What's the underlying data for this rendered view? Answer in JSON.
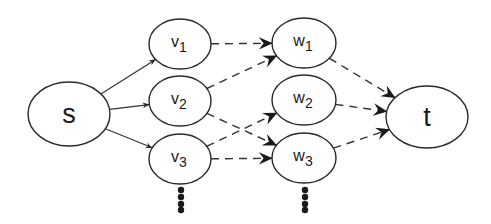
{
  "diagram": {
    "type": "flow-network",
    "colors": {
      "stroke": "#2a2a2a",
      "fill": "#ffffff",
      "text": "#1a1a1a"
    },
    "nodes": [
      {
        "id": "s",
        "label": "s",
        "sub": "",
        "cx": 69,
        "cy": 114,
        "rx": 41,
        "ry": 32
      },
      {
        "id": "v1",
        "label": "v",
        "sub": "1",
        "cx": 180,
        "cy": 44,
        "rx": 31,
        "ry": 25
      },
      {
        "id": "v2",
        "label": "v",
        "sub": "2",
        "cx": 180,
        "cy": 101,
        "rx": 31,
        "ry": 25
      },
      {
        "id": "v3",
        "label": "v",
        "sub": "3",
        "cx": 180,
        "cy": 159,
        "rx": 31,
        "ry": 25
      },
      {
        "id": "w1",
        "label": "w",
        "sub": "1",
        "cx": 304,
        "cy": 43,
        "rx": 32,
        "ry": 25
      },
      {
        "id": "w2",
        "label": "w",
        "sub": "2",
        "cx": 304,
        "cy": 100,
        "rx": 32,
        "ry": 25
      },
      {
        "id": "w3",
        "label": "w",
        "sub": "3",
        "cx": 304,
        "cy": 158,
        "rx": 32,
        "ry": 25
      },
      {
        "id": "t",
        "label": "t",
        "sub": "",
        "cx": 427,
        "cy": 117,
        "rx": 41,
        "ry": 31
      }
    ],
    "edges": [
      {
        "from": "s",
        "to": "v1",
        "style": "solid"
      },
      {
        "from": "s",
        "to": "v2",
        "style": "solid"
      },
      {
        "from": "s",
        "to": "v3",
        "style": "solid"
      },
      {
        "from": "v1",
        "to": "w1",
        "style": "dashed"
      },
      {
        "from": "v2",
        "to": "w1",
        "style": "dashed"
      },
      {
        "from": "v2",
        "to": "w3",
        "style": "dashed"
      },
      {
        "from": "v3",
        "to": "w2",
        "style": "dashed"
      },
      {
        "from": "v3",
        "to": "w3",
        "style": "dashed"
      },
      {
        "from": "w1",
        "to": "t",
        "style": "dashed"
      },
      {
        "from": "w2",
        "to": "t",
        "style": "dashed"
      },
      {
        "from": "w3",
        "to": "t",
        "style": "dashed"
      }
    ],
    "ellipsis": [
      {
        "column": "v",
        "x": 181,
        "ys": [
          190,
          197,
          204,
          210
        ]
      },
      {
        "column": "w",
        "x": 305,
        "ys": [
          190,
          197,
          204,
          210
        ]
      }
    ]
  }
}
